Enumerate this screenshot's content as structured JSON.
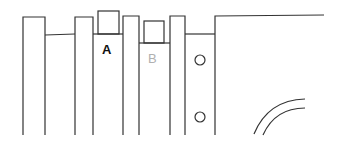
{
  "diagram": {
    "labels": [
      {
        "id": "A",
        "text": "A",
        "color": "#111111"
      },
      {
        "id": "B",
        "text": "B",
        "color": "#b0b0b0"
      }
    ],
    "line_color": "#333333",
    "holes": 2,
    "arcs": 2
  }
}
